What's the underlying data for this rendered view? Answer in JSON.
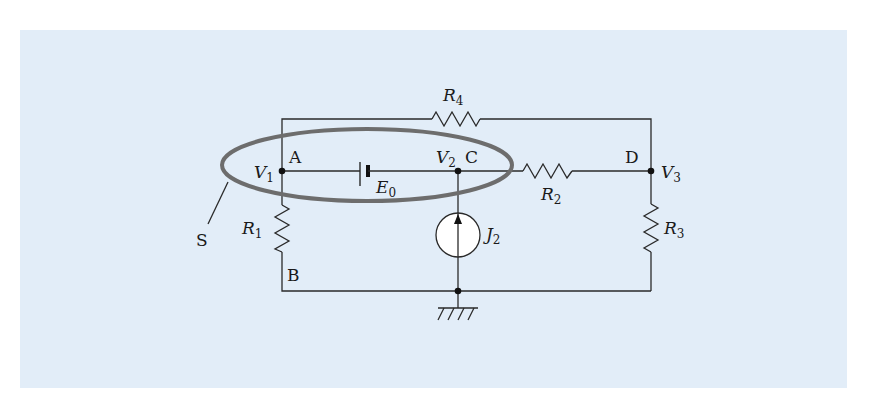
{
  "figure": {
    "background_color": "#e2edf8",
    "surface_label": "S",
    "nodes": [
      {
        "id": "A",
        "label": "A",
        "potential": "V",
        "potential_sub": "1"
      },
      {
        "id": "B",
        "label": "B"
      },
      {
        "id": "C",
        "label": "C",
        "potential": "V",
        "potential_sub": "2"
      },
      {
        "id": "D",
        "label": "D",
        "potential": "V",
        "potential_sub": "3"
      }
    ],
    "components": {
      "R1": {
        "symbol": "R",
        "sub": "1"
      },
      "R2": {
        "symbol": "R",
        "sub": "2"
      },
      "R3": {
        "symbol": "R",
        "sub": "3"
      },
      "R4": {
        "symbol": "R",
        "sub": "4"
      },
      "E0": {
        "symbol": "E",
        "sub": "0"
      },
      "J2": {
        "symbol": "J",
        "sub": "2"
      }
    },
    "ground": "ground-symbol"
  }
}
